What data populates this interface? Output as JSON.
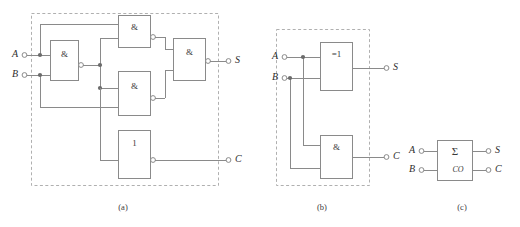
{
  "figure": {
    "background_color": "#ffffff",
    "wire_color": "#8a8a8a",
    "dashed_border_color": "#b0b0b0",
    "junction_color": "#6b6b6b"
  },
  "captions": {
    "a": "(a)",
    "b": "(b)",
    "c": "(c)"
  },
  "panel_a": {
    "caption": "(a)",
    "inputs": [
      {
        "label": "A"
      },
      {
        "label": "B"
      }
    ],
    "outputs": [
      {
        "label": "S"
      },
      {
        "label": "C"
      }
    ],
    "gates": [
      {
        "id": "and-ab",
        "symbol": "&",
        "name": "and-gate-ab"
      },
      {
        "id": "and-top",
        "symbol": "&",
        "name": "and-gate-top"
      },
      {
        "id": "and-mid",
        "symbol": "&",
        "name": "and-gate-middle"
      },
      {
        "id": "and-out",
        "symbol": "&",
        "name": "and-gate-output"
      },
      {
        "id": "or-carry",
        "symbol": "1",
        "name": "or-gate-carry"
      }
    ]
  },
  "panel_b": {
    "caption": "(b)",
    "inputs": [
      {
        "label": "A"
      },
      {
        "label": "B"
      }
    ],
    "outputs": [
      {
        "label": "S"
      },
      {
        "label": "C"
      }
    ],
    "gates": [
      {
        "id": "xor-sum",
        "symbol": "=1",
        "name": "xor-gate-sum"
      },
      {
        "id": "and-carry",
        "symbol": "&",
        "name": "and-gate-carry"
      }
    ]
  },
  "panel_c": {
    "caption": "(c)",
    "inputs": [
      {
        "label": "A"
      },
      {
        "label": "B"
      }
    ],
    "outputs": [
      {
        "label": "S"
      },
      {
        "label": "C"
      }
    ],
    "block": {
      "sum_symbol": "Σ",
      "carry_symbol": "CO",
      "name": "half-adder-block"
    }
  }
}
